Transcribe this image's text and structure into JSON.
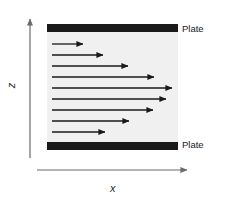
{
  "figure": {
    "background_color": "#ffffff",
    "channel_fill_color": "#f0f0f0",
    "plate_color": "#1a1a1a",
    "arrow_color": "#1a1a1a",
    "axis_color": "#6b6b6b"
  },
  "axes": {
    "vertical": {
      "label": "z",
      "name": "z-axis",
      "direction": "up",
      "x": 30,
      "y_start": 158,
      "y_end": 14
    },
    "horizontal": {
      "label": "x",
      "name": "x-axis",
      "direction": "right",
      "y": 170,
      "x_start": 37,
      "x_end": 192
    }
  },
  "channel": {
    "left": 47,
    "right": 178,
    "top": 24,
    "bottom": 150,
    "plate_thickness": 8
  },
  "plates": [
    {
      "id": "plate-top",
      "label": "Plate",
      "y": 24,
      "x_start": 47,
      "x_end": 178,
      "thickness": 8
    },
    {
      "id": "plate-bottom",
      "label": "Plate",
      "y": 142,
      "x_start": 47,
      "x_end": 178,
      "thickness": 8
    }
  ],
  "chart_data": {
    "type": "line",
    "xlabel": "x",
    "ylabel": "z",
    "grid": false,
    "legend": null,
    "annotations": [
      "Plate",
      "Plate"
    ],
    "profile_shape": "parabolic",
    "arrow_count": 9,
    "arrows": [
      {
        "index": 1,
        "y": 44,
        "x_start": 52,
        "x_tip": 88,
        "length": 36
      },
      {
        "index": 2,
        "y": 55,
        "x_start": 52,
        "x_tip": 108,
        "length": 56
      },
      {
        "index": 3,
        "y": 66,
        "x_start": 52,
        "x_tip": 133,
        "length": 81
      },
      {
        "index": 4,
        "y": 77,
        "x_start": 52,
        "x_tip": 159,
        "length": 107
      },
      {
        "index": 5,
        "y": 88,
        "x_start": 52,
        "x_tip": 177,
        "length": 125
      },
      {
        "index": 6,
        "y": 99,
        "x_start": 52,
        "x_tip": 171,
        "length": 119
      },
      {
        "index": 7,
        "y": 110,
        "x_start": 52,
        "x_tip": 158,
        "length": 106
      },
      {
        "index": 8,
        "y": 121,
        "x_start": 52,
        "x_tip": 134,
        "length": 82
      },
      {
        "index": 9,
        "y": 132,
        "x_start": 52,
        "x_tip": 110,
        "length": 58
      }
    ]
  }
}
